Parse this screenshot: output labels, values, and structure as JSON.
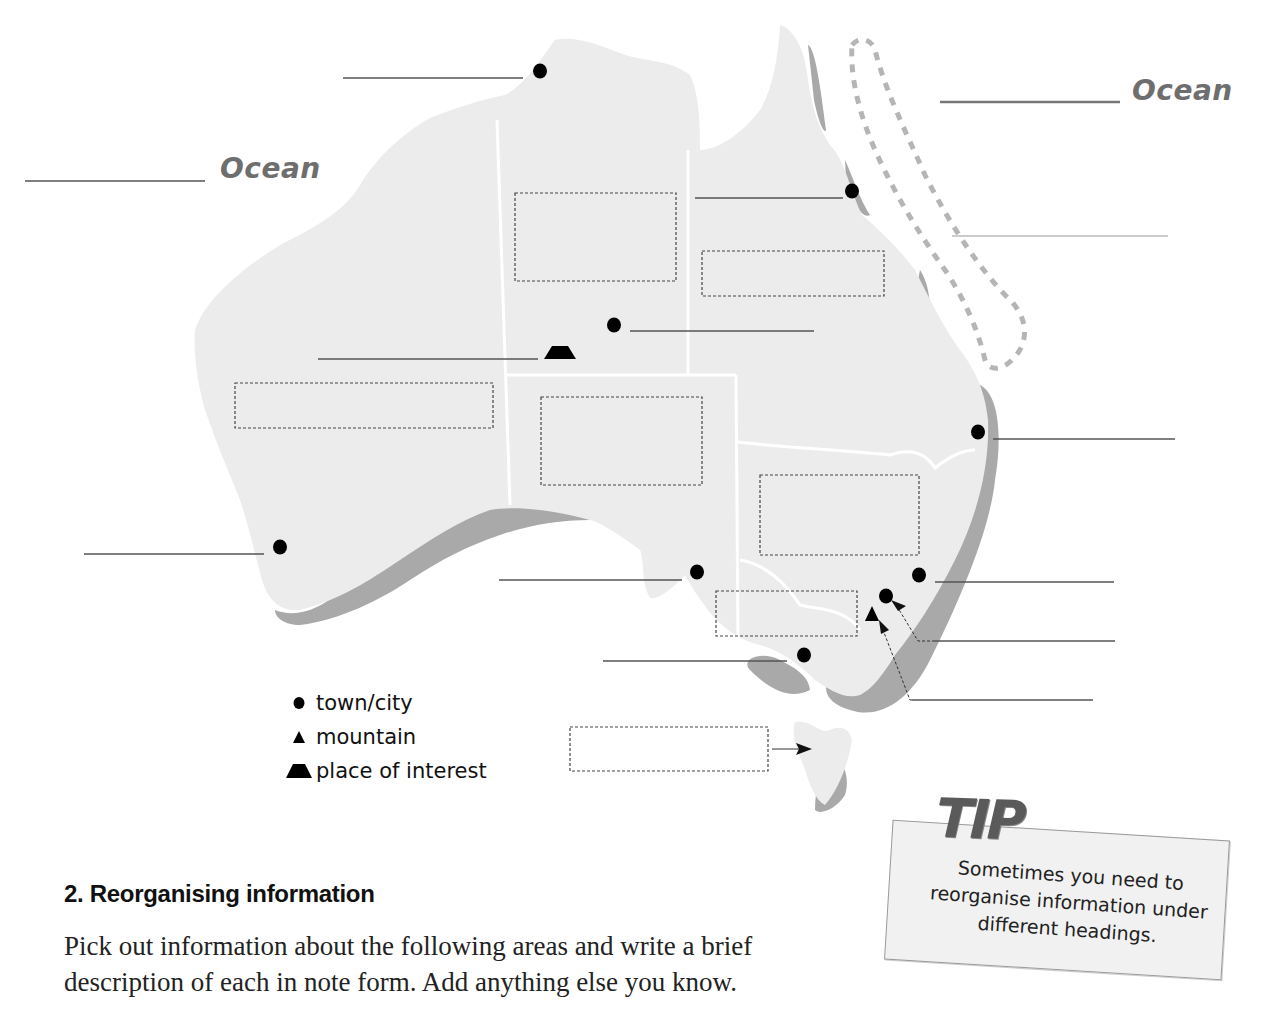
{
  "map": {
    "ocean_labels": [
      {
        "text": "Ocean",
        "position": "west"
      },
      {
        "text": "Ocean",
        "position": "east"
      }
    ],
    "colors": {
      "land": "#ececec",
      "coast_shading": "#a9a9a9",
      "reef_outline": "#b5b5b5",
      "label_lines": "#555555",
      "ocean_text": "#6e6e6e"
    },
    "blank_label_lines": 13,
    "blank_answer_boxes": 8,
    "markers": {
      "towns": 9,
      "mountains": 1,
      "places_of_interest": 1
    }
  },
  "legend": {
    "items": [
      {
        "symbol": "dot",
        "label": "town/city"
      },
      {
        "symbol": "triangle",
        "label": "mountain"
      },
      {
        "symbol": "trapezoid",
        "label": "place of interest"
      }
    ]
  },
  "section": {
    "title": "2.  Reorganising information",
    "body": "Pick out information about the following areas and write a brief description of each in note form. Add anything else you know."
  },
  "tip": {
    "title": "TIP",
    "text": "Sometimes you need to reorganise information under different headings."
  }
}
